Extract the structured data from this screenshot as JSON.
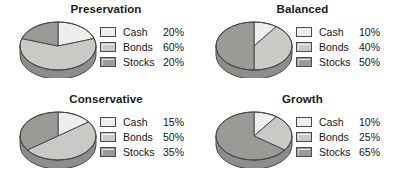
{
  "figure": {
    "background": "#ffffff",
    "series_colors": {
      "Cash": "#eeeeec",
      "Bonds": "#c9c9c5",
      "Stocks": "#9a9a97"
    },
    "edge_color": "#4a4a4a",
    "side_wall_color": "#8d8d8a"
  },
  "chart_data": [
    {
      "type": "pie",
      "title": "Preservation",
      "categories": [
        "Cash",
        "Bonds",
        "Stocks"
      ],
      "values": [
        20,
        60,
        20
      ],
      "labels": [
        "20%",
        "60%",
        "20%"
      ],
      "legend": "right",
      "three_d": true,
      "start_angle_deg": 0,
      "direction": "clockwise"
    },
    {
      "type": "pie",
      "title": "Balanced",
      "categories": [
        "Cash",
        "Bonds",
        "Stocks"
      ],
      "values": [
        10,
        40,
        50
      ],
      "labels": [
        "10%",
        "40%",
        "50%"
      ],
      "legend": "right",
      "three_d": true,
      "start_angle_deg": 0,
      "direction": "clockwise"
    },
    {
      "type": "pie",
      "title": "Conservative",
      "categories": [
        "Cash",
        "Bonds",
        "Stocks"
      ],
      "values": [
        15,
        50,
        35
      ],
      "labels": [
        "15%",
        "50%",
        "35%"
      ],
      "legend": "right",
      "three_d": true,
      "start_angle_deg": 0,
      "direction": "clockwise"
    },
    {
      "type": "pie",
      "title": "Growth",
      "categories": [
        "Cash",
        "Bonds",
        "Stocks"
      ],
      "values": [
        10,
        25,
        65
      ],
      "labels": [
        "10%",
        "25%",
        "65%"
      ],
      "legend": "right",
      "three_d": true,
      "start_angle_deg": 0,
      "direction": "clockwise"
    }
  ]
}
